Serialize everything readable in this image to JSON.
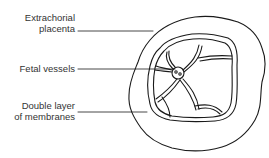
{
  "diagram": {
    "labels": [
      {
        "id": "extrachorial",
        "line1": "Extrachorial",
        "line2": "placenta"
      },
      {
        "id": "fetal-vessels",
        "line1": "Fetal vessels"
      },
      {
        "id": "double-layer",
        "line1": "Double layer",
        "line2": "of membranes"
      }
    ],
    "colors": {
      "stroke": "#1a1a1a",
      "text": "#333333",
      "background": "#ffffff"
    }
  }
}
